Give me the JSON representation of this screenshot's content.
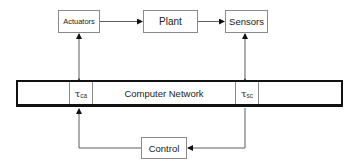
{
  "diagram": {
    "type": "networked-control-system-block-diagram",
    "blocks": {
      "actuators": "Actuators",
      "plant": "Plant",
      "sensors": "Sensors",
      "control": "Control"
    },
    "network": {
      "label": "Computer Network",
      "delay_ca": {
        "symbol": "τ",
        "subscript": "ca"
      },
      "delay_sc": {
        "symbol": "τ",
        "subscript": "sc"
      }
    },
    "edges": [
      {
        "from": "Actuators",
        "to": "Plant",
        "style": "arrow"
      },
      {
        "from": "Plant",
        "to": "Sensors",
        "style": "arrow"
      },
      {
        "from": "Actuators",
        "to": "Computer Network (τca)",
        "style": "bidirectional"
      },
      {
        "from": "Sensors",
        "to": "Computer Network (τsc)",
        "style": "bidirectional"
      },
      {
        "from": "Computer Network (τsc)",
        "to": "Control",
        "style": "arrow"
      },
      {
        "from": "Control",
        "to": "Computer Network (τca)",
        "style": "arrow"
      }
    ],
    "colors": {
      "box_border": "#8a8a8a",
      "network_border": "#111111",
      "line": "#333333",
      "background": "#ffffff"
    }
  }
}
